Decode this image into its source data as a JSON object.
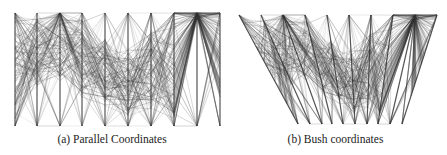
{
  "figure": {
    "panels": [
      {
        "id": "a",
        "caption": "(a) Parallel Coordinates",
        "type": "parallel-coordinates"
      },
      {
        "id": "b",
        "caption": "(b) Bush coordinates",
        "type": "bush-coordinates"
      }
    ]
  },
  "colors": {
    "axis": "#555555",
    "line": "#333333",
    "background": "#ffffff"
  },
  "chart_data": [
    {
      "type": "parallel-coordinates",
      "title": "(a) Parallel Coordinates",
      "num_axes": 10,
      "axis_x": [
        15,
        37,
        60,
        82,
        105,
        128,
        151,
        174,
        197,
        220
      ],
      "axis_top_y": 13,
      "axis_bottom_y": 126,
      "num_lines": 120,
      "axis_labels": []
    },
    {
      "type": "bush-coordinates",
      "title": "(b) Bush coordinates",
      "num_axes": 10,
      "axis_top_x": [
        15,
        37,
        59,
        81,
        103,
        125,
        147,
        169,
        191,
        213
      ],
      "axis_bottom_x": [
        74,
        86,
        98,
        108,
        119,
        131,
        143,
        154,
        166,
        178
      ],
      "axis_top_y": 15,
      "axis_bottom_y": 124,
      "num_lines": 120,
      "axis_labels": []
    }
  ]
}
